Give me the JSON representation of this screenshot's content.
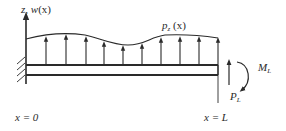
{
  "diagram": {
    "type": "cantilever-beam-loading",
    "colors": {
      "stroke": "#2a2a2a",
      "background": "#ffffff"
    },
    "labels": {
      "axis_label_main": "z, w",
      "axis_label_arg": "(x)",
      "load_label_main": "p",
      "load_label_sub": "z",
      "load_label_arg": " (x)",
      "moment_label_main": "M",
      "moment_label_sub": "L",
      "force_label_main": "P",
      "force_label_sub": "L",
      "left_end_label": "x = 0",
      "right_end_label": "x = L"
    },
    "elements": {
      "fixed_support": "clamped wall at x = 0",
      "beam": "cantilever beam from x = 0 to x = L",
      "distributed_load": "upward distributed load p_z(x)",
      "tip_force": "upward point force P_L at x = L",
      "tip_moment": "clockwise moment M_L at x = L",
      "load_arrow_count": 10
    }
  }
}
